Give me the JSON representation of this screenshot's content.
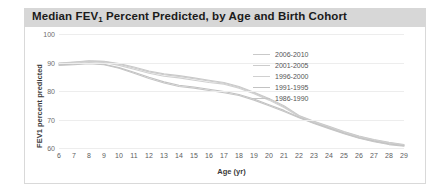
{
  "chart_data": {
    "type": "line",
    "title": "Median FEV1 Percent Predicted, by Age and Birth Cohort",
    "title_prefix": "Median FEV",
    "title_sub": "1",
    "title_suffix": " Percent Predicted, by Age and Birth Cohort",
    "xlabel": "Age (yr)",
    "ylabel": "FEV1 percent predicted",
    "xlim": [
      6,
      29
    ],
    "ylim": [
      60,
      100
    ],
    "grid": "horizontal",
    "legend_position": "top-right",
    "xticks": [
      6,
      7,
      8,
      9,
      10,
      11,
      12,
      13,
      14,
      15,
      16,
      17,
      18,
      19,
      20,
      21,
      22,
      23,
      24,
      25,
      26,
      27,
      28,
      29
    ],
    "yticks": [
      60,
      70,
      80,
      90,
      100
    ],
    "x": [
      6,
      7,
      8,
      9,
      10,
      11,
      12,
      13,
      14,
      15,
      16,
      17,
      18,
      19,
      20,
      21,
      22,
      23,
      24,
      25,
      26,
      27,
      28,
      29
    ],
    "series": [
      {
        "name": "2006-2010",
        "color": "#c9c9c9",
        "values": [
          89.8,
          90.2,
          90.6,
          90.4,
          89.6,
          88.4,
          87.0,
          86.0,
          85.4,
          84.6,
          83.8,
          83.0,
          81.6,
          79.6,
          77.4,
          74.8,
          71.4,
          69.4,
          67.6,
          65.8,
          64.2,
          63.0,
          62.0,
          61.2
        ]
      },
      {
        "name": "2001-2005",
        "color": "#cccccc",
        "values": [
          89.7,
          90.1,
          90.5,
          90.3,
          89.4,
          88.1,
          86.7,
          85.7,
          85.1,
          84.3,
          83.5,
          82.7,
          81.3,
          79.3,
          77.1,
          74.5,
          71.2,
          69.2,
          67.4,
          65.6,
          64.0,
          62.8,
          61.8,
          61.0
        ]
      },
      {
        "name": "1996-2000",
        "color": "#d0d0d0",
        "values": [
          89.4,
          89.8,
          90.2,
          90.0,
          89.0,
          87.6,
          86.2,
          85.2,
          84.6,
          83.8,
          83.0,
          82.4,
          81.0,
          79.0,
          76.8,
          74.2,
          71.0,
          69.0,
          67.2,
          65.4,
          63.8,
          62.6,
          61.6,
          60.9
        ]
      },
      {
        "name": "1991-1995",
        "color": "#c2c2c2",
        "values": [
          89.2,
          89.4,
          89.8,
          89.4,
          88.2,
          86.6,
          84.8,
          83.2,
          82.0,
          81.4,
          80.6,
          79.8,
          78.8,
          77.2,
          75.2,
          73.2,
          70.8,
          68.8,
          67.0,
          65.2,
          63.6,
          62.4,
          61.4,
          60.8
        ]
      },
      {
        "name": "1986-1990",
        "color": "#c5c5c5",
        "values": [
          89.0,
          89.2,
          89.6,
          89.2,
          88.0,
          86.2,
          84.4,
          82.8,
          81.6,
          81.0,
          80.2,
          79.4,
          78.4,
          76.8,
          74.8,
          72.8,
          70.6,
          68.6,
          66.8,
          65.0,
          63.4,
          62.2,
          61.2,
          60.6
        ]
      }
    ]
  }
}
